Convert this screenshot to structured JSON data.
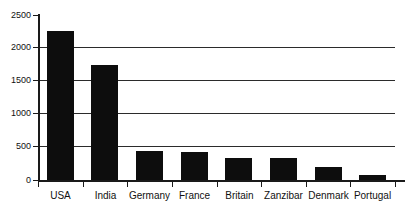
{
  "chart_data": {
    "type": "bar",
    "title": "",
    "subtitle": "",
    "xlabel": "",
    "ylabel": "",
    "categories": [
      "USA",
      "India",
      "Germany",
      "France",
      "Britain",
      "Zanzibar",
      "Denmark",
      "Portugal"
    ],
    "values": [
      2250,
      1740,
      440,
      420,
      340,
      340,
      190,
      70
    ],
    "series": [
      {
        "name": "",
        "values": [
          2250,
          1740,
          440,
          420,
          340,
          340,
          190,
          70
        ]
      }
    ],
    "ylim": [
      0,
      2500
    ],
    "yticks": [
      0,
      500,
      1000,
      1500,
      2000,
      2500
    ],
    "ytick_labels": [
      "0",
      "500",
      "1000",
      "1500",
      "2000",
      "2500"
    ],
    "gridlines_at": [
      500,
      1000,
      1500,
      2000
    ],
    "grid": true,
    "grid_axis": "y",
    "legend": false,
    "legend_position": "none",
    "bar_color": "#0d0d0d",
    "axis_color": "#1a1a1a",
    "grid_color": "#2b2b2b",
    "background_color": "#ffffff",
    "annotations": []
  }
}
